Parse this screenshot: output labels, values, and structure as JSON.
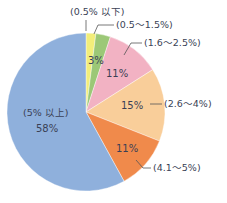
{
  "chart_data": {
    "type": "pie",
    "title": "",
    "start_angle_deg": 0,
    "direction": "clockwise",
    "slices": [
      {
        "category": "(0.5% 以下)",
        "value": 2,
        "display_pct": "",
        "color": "#f2ee7a"
      },
      {
        "category": "(0.5～1.5%)",
        "value": 3,
        "display_pct": "3%",
        "color": "#9cc877"
      },
      {
        "category": "(1.6～2.5%)",
        "value": 11,
        "display_pct": "11%",
        "color": "#f2b2c3"
      },
      {
        "category": "(2.6～4%)",
        "value": 15,
        "display_pct": "15%",
        "color": "#f9ce9a"
      },
      {
        "category": "(4.1～5%)",
        "value": 11,
        "display_pct": "11%",
        "color": "#f08a4b"
      },
      {
        "category": "(5% 以上)",
        "value": 58,
        "display_pct": "58%",
        "color": "#8fb0dc"
      }
    ],
    "legend": "none (leader-line callouts)"
  },
  "labels": {
    "s0": "(0.5% 以下)",
    "s1": "(0.5～1.5%)",
    "s2": "(1.6～2.5%)",
    "s3": "(2.6～4%)",
    "s4": "(4.1～5%)",
    "s5": "(5% 以上)"
  },
  "percents": {
    "s1": "3%",
    "s2": "11%",
    "s3": "15%",
    "s4": "11%",
    "s5": "58%"
  }
}
